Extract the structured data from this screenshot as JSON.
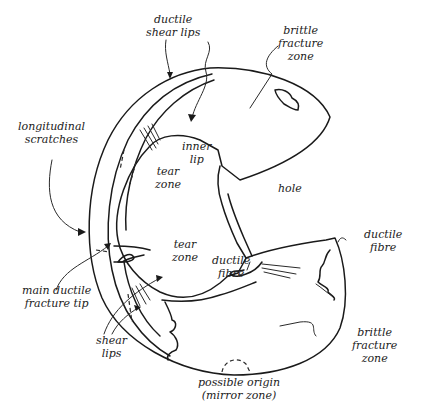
{
  "diagram": {
    "stroke_color": "#1a1a1a",
    "background": "#ffffff",
    "labels": {
      "ductile_shear_lips": [
        "ductile",
        "shear lips"
      ],
      "brittle_fracture_zone_top": [
        "brittle",
        "fracture",
        "zone"
      ],
      "longitudinal_scratches": [
        "longitudinal",
        "scratches"
      ],
      "inner_lip": [
        "inner",
        "lip"
      ],
      "tear_zone_upper": [
        "tear",
        "zone"
      ],
      "hole": [
        "hole"
      ],
      "tear_zone_lower": [
        "tear",
        "zone"
      ],
      "ductile_fibre_inner": [
        "ductile",
        "fibre"
      ],
      "ductile_fibre_outer": [
        "ductile",
        "fibre"
      ],
      "main_ductile_fracture_tip": [
        "main ductile",
        "fracture tip"
      ],
      "shear_lips": [
        "shear",
        "lips"
      ],
      "brittle_fracture_zone_bottom": [
        "brittle",
        "fracture",
        "zone"
      ],
      "possible_origin": [
        "possible origin",
        "(mirror zone)"
      ]
    }
  }
}
